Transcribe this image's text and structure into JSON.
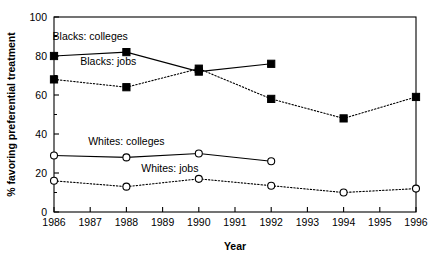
{
  "chart_data": {
    "type": "line",
    "title": "",
    "xlabel": "Year",
    "ylabel": "% favoring preferential treatment",
    "xlim": [
      1986,
      1996
    ],
    "ylim": [
      0,
      100
    ],
    "grid": false,
    "legend_position": "inline-annotations",
    "x_ticks": [
      1986,
      1987,
      1988,
      1989,
      1990,
      1991,
      1992,
      1993,
      1994,
      1995,
      1996
    ],
    "x_tick_labels": [
      "1986",
      "1987",
      "1988",
      "1989",
      "1990",
      "1991",
      "1992",
      "1993",
      "1994",
      "1995",
      "1996"
    ],
    "y_ticks": [
      0,
      20,
      40,
      60,
      80,
      100
    ],
    "y_tick_labels": [
      "0",
      "20",
      "40",
      "60",
      "80",
      "100"
    ],
    "y_minor_ticks": [
      10,
      30,
      50,
      70,
      90
    ],
    "series": [
      {
        "name": "Blacks: colleges",
        "label": "Blacks: colleges",
        "marker": "filled-square",
        "line_style": "solid",
        "color": "#000000",
        "x": [
          1986,
          1988,
          1990,
          1992
        ],
        "values": [
          80,
          82,
          72,
          76
        ]
      },
      {
        "name": "Blacks: jobs",
        "label": "Blacks: jobs",
        "marker": "filled-square",
        "line_style": "dotted",
        "color": "#000000",
        "x": [
          1986,
          1988,
          1990,
          1992,
          1994,
          1996
        ],
        "values": [
          68,
          64,
          73.5,
          58,
          48,
          59
        ]
      },
      {
        "name": "Whites: colleges",
        "label": "Whites: colleges",
        "marker": "open-circle",
        "line_style": "solid",
        "color": "#000000",
        "x": [
          1986,
          1988,
          1990,
          1992
        ],
        "values": [
          29,
          28,
          30,
          26
        ]
      },
      {
        "name": "Whites: jobs",
        "label": "Whites: jobs",
        "marker": "open-circle",
        "line_style": "dotted",
        "color": "#000000",
        "x": [
          1986,
          1988,
          1990,
          1992,
          1994,
          1996
        ],
        "values": [
          16,
          13,
          17,
          13.5,
          10,
          12
        ]
      }
    ],
    "annotations": [
      {
        "text": "Blacks: colleges",
        "x": 1987.0,
        "y": 90
      },
      {
        "text": "Blacks: jobs",
        "x": 1987.5,
        "y": 77
      },
      {
        "text": "Whites: colleges",
        "x": 1988.0,
        "y": 36
      },
      {
        "text": "Whites: jobs",
        "x": 1989.2,
        "y": 22.5
      }
    ]
  }
}
